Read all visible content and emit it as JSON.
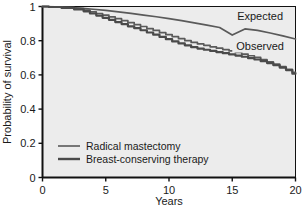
{
  "chart_data": {
    "type": "line",
    "title": "",
    "xlabel": "Years",
    "ylabel": "Probability of survival",
    "xlim": [
      0,
      20
    ],
    "ylim": [
      0,
      1
    ],
    "grid": false,
    "background": "#ececec",
    "line_color": "#4d4d4d",
    "axis_color": "#111111",
    "xticks": [
      "0",
      "5",
      "10",
      "15",
      "20"
    ],
    "xtick_values": [
      0,
      5,
      10,
      15,
      20
    ],
    "yticks": [
      "0",
      "0.2",
      "0.4",
      "0.6",
      "0.8",
      "1"
    ],
    "ytick_values": [
      0,
      0.2,
      0.4,
      0.6,
      0.8,
      1
    ],
    "annotations": [
      {
        "text": "Expected",
        "x": 17.2,
        "y": 0.93
      },
      {
        "text": "Observed",
        "x": 17.2,
        "y": 0.76
      }
    ],
    "legend": {
      "position": "inside-lower-left",
      "entries": [
        {
          "name": "Radical mastectomy",
          "color": "#5a5a5a",
          "width": 1.6
        },
        {
          "name": "Breast-conserving therapy",
          "color": "#4a4a4a",
          "width": 2.4
        }
      ]
    },
    "series": [
      {
        "name": "Expected",
        "kind": "smooth",
        "color": "#5a5a5a",
        "x": [
          0,
          1,
          2,
          3,
          4,
          5,
          6,
          7,
          8,
          9,
          10,
          11,
          12,
          13,
          14,
          15,
          16,
          17,
          18,
          19,
          20
        ],
        "values": [
          1.0,
          0.998,
          0.995,
          0.99,
          0.984,
          0.977,
          0.969,
          0.96,
          0.95,
          0.94,
          0.929,
          0.917,
          0.904,
          0.891,
          0.877,
          0.833,
          0.869,
          0.86,
          0.845,
          0.828,
          0.81
        ]
      },
      {
        "name": "Radical mastectomy",
        "kind": "step",
        "color": "#5a5a5a",
        "x": [
          0,
          1,
          2,
          3,
          3.5,
          4,
          4.5,
          5,
          5.5,
          6,
          6.5,
          7,
          7.5,
          8,
          8.5,
          9,
          9.5,
          10,
          10.5,
          11,
          11.5,
          12,
          12.5,
          13,
          13.5,
          14,
          14.5,
          15,
          15.5,
          16,
          16.5,
          17,
          17.5,
          18,
          18.5,
          19,
          19.5,
          20
        ],
        "values": [
          1.0,
          0.998,
          0.994,
          0.987,
          0.979,
          0.969,
          0.959,
          0.95,
          0.939,
          0.929,
          0.917,
          0.906,
          0.894,
          0.883,
          0.871,
          0.86,
          0.847,
          0.836,
          0.824,
          0.812,
          0.8,
          0.79,
          0.781,
          0.773,
          0.764,
          0.756,
          0.748,
          0.74,
          0.731,
          0.722,
          0.712,
          0.702,
          0.69,
          0.677,
          0.663,
          0.648,
          0.632,
          0.615
        ]
      },
      {
        "name": "Breast-conserving therapy",
        "kind": "step",
        "color": "#4a4a4a",
        "x": [
          0,
          1,
          2,
          3,
          3.5,
          4,
          4.5,
          5,
          5.5,
          6,
          6.5,
          7,
          7.5,
          8,
          8.5,
          9,
          9.5,
          10,
          10.5,
          11,
          11.5,
          12,
          12.5,
          13,
          13.5,
          14,
          14.5,
          15,
          15.5,
          16,
          16.5,
          17,
          17.5,
          18,
          18.5,
          19,
          19.5,
          20
        ],
        "values": [
          1.0,
          0.997,
          0.992,
          0.983,
          0.972,
          0.959,
          0.947,
          0.934,
          0.922,
          0.909,
          0.897,
          0.884,
          0.873,
          0.861,
          0.848,
          0.835,
          0.822,
          0.809,
          0.796,
          0.784,
          0.773,
          0.762,
          0.754,
          0.747,
          0.74,
          0.733,
          0.727,
          0.72,
          0.713,
          0.706,
          0.698,
          0.69,
          0.68,
          0.669,
          0.657,
          0.643,
          0.628,
          0.607
        ]
      }
    ]
  }
}
